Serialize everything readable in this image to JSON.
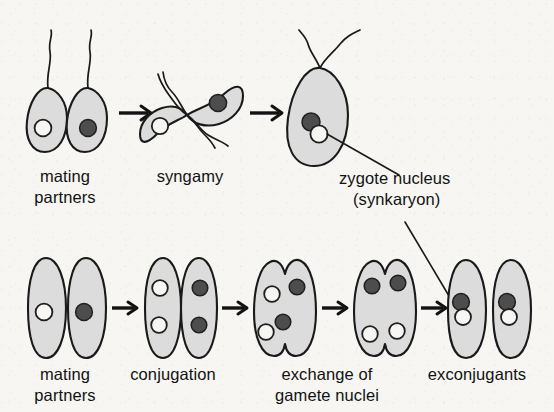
{
  "figure": {
    "background_color": "#f7f6f3",
    "ink_color": "#121212",
    "cell_fill_color": "#dcdcdc",
    "dark_nucleus_color": "#4d4d4d",
    "light_nucleus_color": "#f7f6f3"
  },
  "rows": {
    "top": {
      "name": "syngamy-pathway",
      "stages": [
        {
          "id": "top-mating-partners",
          "label_line1": "mating",
          "label_line2": "partners",
          "cell_shape": "teardrop-flagellate",
          "cell_count": 2,
          "nuclei": [
            "light",
            "dark"
          ],
          "flagella_per_cell": 1
        },
        {
          "id": "syngamy",
          "label_line1": "syngamy",
          "label_line2": "",
          "cell_shape": "teardrop-flagellate-pair-fusing",
          "cell_count": 2,
          "nuclei": [
            "light",
            "dark"
          ],
          "flagella_per_cell": 1
        },
        {
          "id": "zygote",
          "label_line1": "zygote nucleus",
          "label_line2": "(synkaryon)",
          "cell_shape": "teardrop-zygote",
          "cell_count": 1,
          "nuclei": [
            "dark",
            "light"
          ],
          "flagella_per_cell": 2
        }
      ],
      "arrow_count": 2
    },
    "bottom": {
      "name": "conjugation-pathway",
      "stages": [
        {
          "id": "bottom-mating-partners",
          "label_line1": "mating",
          "label_line2": "partners",
          "cell_shape": "slipper",
          "cell_count": 2,
          "nuclei_left": [
            "light"
          ],
          "nuclei_right": [
            "dark"
          ]
        },
        {
          "id": "conjugation",
          "label_line1": "conjugation",
          "label_line2": "",
          "cell_shape": "slipper-pair-joined",
          "cell_count": 2,
          "nuclei_left": [
            "light",
            "light"
          ],
          "nuclei_right": [
            "dark",
            "dark"
          ]
        },
        {
          "id": "exchange",
          "label_line1": "exchange of",
          "label_line2": "gamete nuclei",
          "cell_shape": "slipper-pair-joined",
          "cell_count": 2,
          "nuclei_left": [
            "light",
            "light"
          ],
          "nuclei_right": [
            "dark",
            "dark"
          ],
          "note": "nuclei crossing between partners"
        },
        {
          "id": "exchange-complete",
          "label_line1": "",
          "label_line2": "",
          "cell_shape": "slipper-pair-joined",
          "cell_count": 2,
          "nuclei_top": [
            "dark",
            "dark"
          ],
          "nuclei_bottom": [
            "light",
            "light"
          ]
        },
        {
          "id": "exconjugants",
          "label_line1": "exconjugants",
          "label_line2": "",
          "cell_shape": "slipper",
          "cell_count": 2,
          "nuclei_each": [
            "dark",
            "light"
          ],
          "note": "fused synkaryon in each cell"
        }
      ],
      "arrow_count": 4
    }
  },
  "annotations": [
    {
      "id": "synkaryon-callout",
      "text_line1": "zygote nucleus",
      "text_line2": "(synkaryon)",
      "points_to": [
        "zygote-nucleus-pair",
        "exconjugant-left-nucleus-pair"
      ]
    }
  ]
}
